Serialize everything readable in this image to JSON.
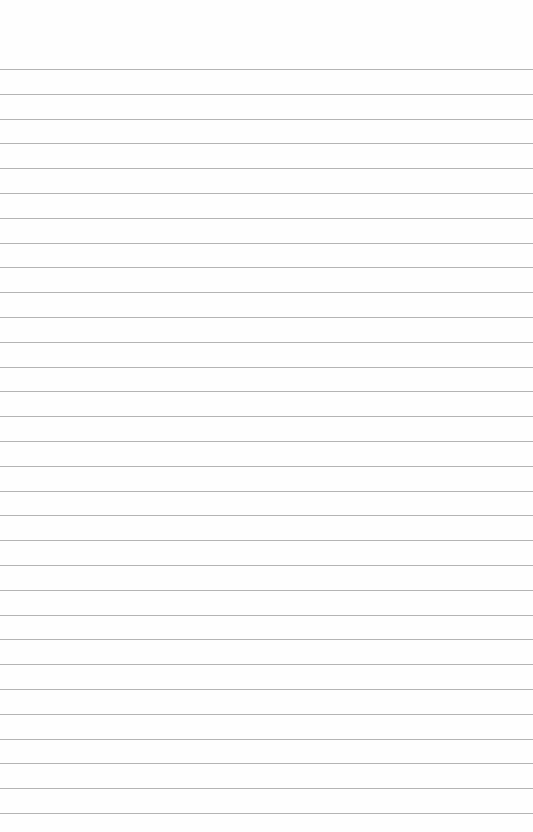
{
  "page": {
    "type": "lined-paper",
    "background": "#fefefe",
    "line_color": "#b4b4b4",
    "line_count": 31,
    "first_line_y": 69,
    "line_spacing": 24.8
  }
}
